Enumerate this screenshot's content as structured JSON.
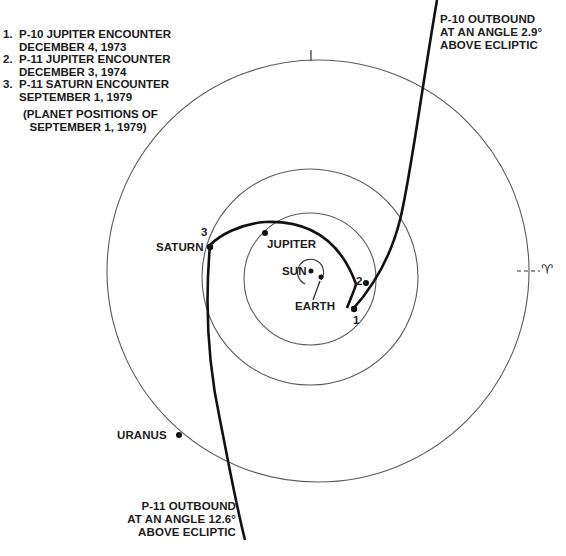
{
  "legend": {
    "items": [
      {
        "num": "1.",
        "line1": "P-10 JUPITER ENCOUNTER",
        "line2": "DECEMBER 4, 1973"
      },
      {
        "num": "2.",
        "line1": "P-11 JUPITER ENCOUNTER",
        "line2": "DECEMBER 3, 1974"
      },
      {
        "num": "3.",
        "line1": "P-11 SATURN ENCOUNTER",
        "line2": "SEPTEMBER 1, 1979"
      }
    ],
    "note_line1": "(PLANET POSITIONS OF",
    "note_line2": "SEPTEMBER 1, 1979)"
  },
  "p10_outbound": {
    "line1": "P-10 OUTBOUND",
    "line2": "AT AN ANGLE 2.9°",
    "line3": "ABOVE ECLIPTIC"
  },
  "p11_outbound": {
    "line1": "P-11 OUTBOUND",
    "line2": "AT AN ANGLE 12.6°",
    "line3": "ABOVE ECLIPTIC"
  },
  "bodies": {
    "sun": "SUN",
    "earth": "EARTH",
    "jupiter": "JUPITER",
    "saturn": "SATURN",
    "uranus": "URANUS"
  },
  "encounter_markers": {
    "m1": "1",
    "m2": "2",
    "m3": "3"
  },
  "vernal_equinox_symbol": "♈︎",
  "colors": {
    "orbit": "#555555",
    "trajectory": "#111111",
    "text": "#1c1c1c"
  }
}
